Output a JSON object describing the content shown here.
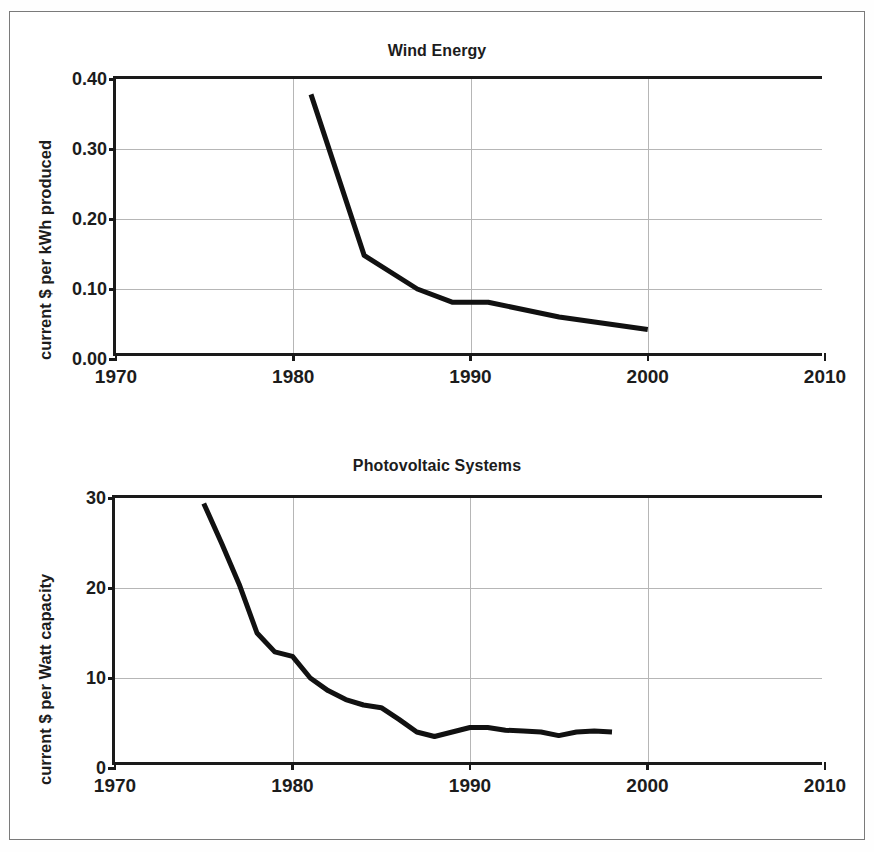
{
  "figure": {
    "background_color": "#ffffff",
    "border_color": "#7a7a7a",
    "line_color": "#111111",
    "axis_color": "#1a1a1a",
    "grid_color": "#b6b6b6"
  },
  "chart_data": [
    {
      "type": "line",
      "title": "Wind Energy",
      "xlabel": "",
      "ylabel": "current $ per kWh produced",
      "xlim": [
        1970,
        2010
      ],
      "ylim": [
        0.0,
        0.4
      ],
      "xticks": [
        1970,
        1980,
        1990,
        2000,
        2010
      ],
      "xtick_labels": [
        "1970",
        "1980",
        "1990",
        "2000",
        "2010"
      ],
      "yticks": [
        0.0,
        0.1,
        0.2,
        0.3,
        0.4
      ],
      "ytick_labels": [
        "0.00",
        "0.10",
        "0.20",
        "0.30",
        "0.40"
      ],
      "grid": true,
      "legend": null,
      "series": [
        {
          "name": "Wind energy cost",
          "x": [
            1981,
            1984,
            1987,
            1989,
            1991,
            1995,
            2000
          ],
          "values": [
            0.378,
            0.148,
            0.1,
            0.081,
            0.081,
            0.06,
            0.042
          ]
        }
      ]
    },
    {
      "type": "line",
      "title": "Photovoltaic Systems",
      "xlabel": "",
      "ylabel": "current $ per Watt capacity",
      "xlim": [
        1970,
        2010
      ],
      "ylim": [
        0,
        30
      ],
      "xticks": [
        1970,
        1980,
        1990,
        2000,
        2010
      ],
      "xtick_labels": [
        "1970",
        "1980",
        "1990",
        "2000",
        "2010"
      ],
      "yticks": [
        0,
        10,
        20,
        30
      ],
      "ytick_labels": [
        "0",
        "10",
        "20",
        "30"
      ],
      "grid": true,
      "legend": null,
      "series": [
        {
          "name": "Photovoltaic system cost",
          "x": [
            1975,
            1976,
            1977,
            1978,
            1979,
            1980,
            1981,
            1982,
            1983,
            1984,
            1985,
            1986,
            1987,
            1988,
            1989,
            1990,
            1991,
            1992,
            1993,
            1994,
            1995,
            1996,
            1997,
            1998
          ],
          "values": [
            29.4,
            25.0,
            20.4,
            15.0,
            12.9,
            12.4,
            10.0,
            8.6,
            7.6,
            7.0,
            6.7,
            5.4,
            4.0,
            3.5,
            4.0,
            4.5,
            4.5,
            4.2,
            4.1,
            4.0,
            3.6,
            4.0,
            4.1,
            4.0
          ]
        }
      ]
    }
  ]
}
